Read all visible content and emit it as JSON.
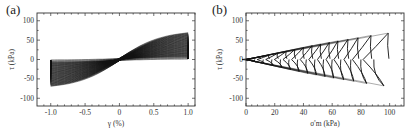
{
  "figure": {
    "panels": [
      {
        "label": "(a)"
      },
      {
        "label": "(b)"
      }
    ]
  },
  "chart_data": [
    {
      "panel": "(a)",
      "type": "line",
      "title": "",
      "xlabel": "γ (%)",
      "ylabel": "τ (kPa)",
      "xlim": [
        -1.2,
        1.1
      ],
      "ylim": [
        -120,
        120
      ],
      "xticks": [
        -1.0,
        -0.5,
        0,
        0.5,
        1.0
      ],
      "xtick_labels": [
        "-1.0",
        "-0.5",
        "0",
        "0.5",
        "1.0"
      ],
      "yticks": [
        -100,
        -50,
        0,
        50,
        100
      ],
      "ytick_labels": [
        "-100",
        "-50",
        "0",
        "50",
        "100"
      ],
      "grid": false,
      "legend": null,
      "description": "Dense set of stress-strain hysteresis loops between γ = -1.0% and 1.0%; loops tilt from near-zero stress (early cycles) to about ±70 kPa peak stress (later cycles).",
      "series": [
        {
          "name": "first cycle",
          "x": [
            -1.0,
            -0.5,
            0,
            0.5,
            1.0
          ],
          "y": [
            0,
            0,
            2,
            3,
            4
          ]
        },
        {
          "name": "last cycle upper branch",
          "x": [
            -1.0,
            -0.5,
            0,
            0.4,
            1.0
          ],
          "y": [
            -5,
            -2,
            10,
            35,
            70
          ]
        },
        {
          "name": "last cycle lower branch",
          "x": [
            1.0,
            0.5,
            0,
            -0.4,
            -1.0
          ],
          "y": [
            5,
            2,
            -10,
            -35,
            -70
          ]
        }
      ]
    },
    {
      "panel": "(b)",
      "type": "line",
      "title": "",
      "xlabel": "σ'm (kPa)",
      "ylabel": "τ (kPa)",
      "xlim": [
        0,
        110
      ],
      "ylim": [
        -120,
        120
      ],
      "xticks": [
        0,
        20,
        40,
        60,
        80,
        100
      ],
      "xtick_labels": [
        "0",
        "20",
        "40",
        "60",
        "80",
        "100"
      ],
      "yticks": [
        -100,
        -50,
        0,
        50,
        100
      ],
      "ytick_labels": [
        "-100",
        "-50",
        "0",
        "50",
        "100"
      ],
      "grid": false,
      "legend": null,
      "description": "Effective stress path: butterfly-shaped loops moving from σ'm = 100 kPa toward 0 kPa, with shear stress amplitude decreasing from about ±65 kPa to 0.",
      "loops": [
        {
          "sigma_m_peak": 100,
          "tau_max": 68,
          "tau_min": -68
        },
        {
          "sigma_m_peak": 88,
          "tau_max": 62,
          "tau_min": -62
        },
        {
          "sigma_m_peak": 79,
          "tau_max": 56,
          "tau_min": -56
        },
        {
          "sigma_m_peak": 72,
          "tau_max": 52,
          "tau_min": -52
        },
        {
          "sigma_m_peak": 65,
          "tau_max": 48,
          "tau_min": -48
        },
        {
          "sigma_m_peak": 59,
          "tau_max": 44,
          "tau_min": -44
        },
        {
          "sigma_m_peak": 53,
          "tau_max": 40,
          "tau_min": -40
        },
        {
          "sigma_m_peak": 47,
          "tau_max": 36,
          "tau_min": -36
        },
        {
          "sigma_m_peak": 41,
          "tau_max": 31,
          "tau_min": -31
        },
        {
          "sigma_m_peak": 35,
          "tau_max": 26,
          "tau_min": -26
        },
        {
          "sigma_m_peak": 29,
          "tau_max": 21,
          "tau_min": -21
        },
        {
          "sigma_m_peak": 23,
          "tau_max": 16,
          "tau_min": -16
        },
        {
          "sigma_m_peak": 17,
          "tau_max": 11,
          "tau_min": -11
        },
        {
          "sigma_m_peak": 11,
          "tau_max": 7,
          "tau_min": -7
        },
        {
          "sigma_m_peak": 5,
          "tau_max": 3,
          "tau_min": -3
        }
      ]
    }
  ]
}
